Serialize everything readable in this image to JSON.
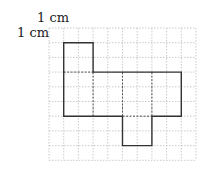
{
  "labels": {
    "top_unit": "1 cm",
    "left_unit": "1 cm"
  },
  "grid": {
    "origin_x": 49,
    "origin_y": 28,
    "cell": 14.7,
    "cols": 10,
    "rows": 9,
    "color": "#b5b5b5"
  },
  "net": {
    "outline_color": "#333333",
    "fold_color": "#555555",
    "outline": [
      [
        1,
        1
      ],
      [
        3,
        1
      ],
      [
        3,
        3
      ],
      [
        9,
        3
      ],
      [
        9,
        6
      ],
      [
        7,
        6
      ],
      [
        7,
        8
      ],
      [
        5,
        8
      ],
      [
        5,
        6
      ],
      [
        1,
        6
      ]
    ],
    "folds": [
      [
        [
          1,
          3
        ],
        [
          3,
          3
        ]
      ],
      [
        [
          3,
          3
        ],
        [
          3,
          6
        ]
      ],
      [
        [
          5,
          3
        ],
        [
          5,
          6
        ]
      ],
      [
        [
          7,
          3
        ],
        [
          7,
          6
        ]
      ],
      [
        [
          5,
          6
        ],
        [
          7,
          6
        ]
      ]
    ]
  }
}
